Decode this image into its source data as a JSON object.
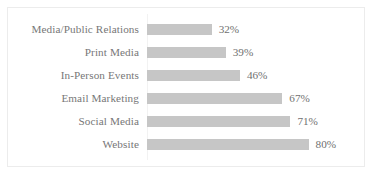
{
  "chart_data": {
    "type": "bar",
    "orientation": "horizontal",
    "title": "",
    "subtitle": "",
    "xlabel": "",
    "ylabel": "",
    "categories": [
      "Media/Public Relations",
      "Print Media",
      "In-Person Events",
      "Email Marketing",
      "Social Media",
      "Website"
    ],
    "values": [
      32,
      39,
      46,
      67,
      71,
      80
    ],
    "value_labels": [
      "32%",
      "39%",
      "46%",
      "67%",
      "71%",
      "80%"
    ],
    "unit": "%",
    "xlim": [
      0,
      100
    ],
    "grid": false,
    "legend": null,
    "bar_color": "#c6c6c6",
    "label_color": "#777777",
    "value_color": "#707070",
    "background_color": "#ffffff",
    "border_color": "#ececec"
  }
}
